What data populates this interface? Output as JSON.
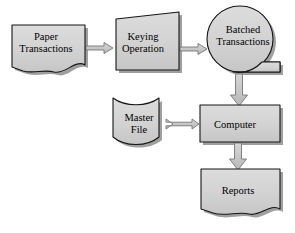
{
  "diagram": {
    "background_color": "#ffffff",
    "shape_fill": "#d2d2d2",
    "shape_stroke": "#1a1a1a",
    "shadow_color": "#8a8a8a",
    "arrow_fill": "#c0c0c0",
    "arrow_stroke": "#6e6e6e",
    "nodes": [
      {
        "id": "paper-transactions",
        "label": "Paper\nTransactions",
        "line1": "Paper",
        "line2": "Transactions",
        "shape": "document"
      },
      {
        "id": "keying-operation",
        "label": "Keying\nOperation",
        "line1": "Keying",
        "line2": "Operation",
        "shape": "manual-operation-trapezoid"
      },
      {
        "id": "batched-transactions",
        "label": "Batched\nTransactions",
        "line1": "Batched",
        "line2": "Transactions",
        "shape": "offline-storage-circle"
      },
      {
        "id": "master-file",
        "label": "Master\nFile",
        "line1": "Master",
        "line2": "File",
        "shape": "magnetic-disk"
      },
      {
        "id": "computer",
        "label": "Computer",
        "line1": "Computer",
        "line2": "",
        "shape": "process-rectangle"
      },
      {
        "id": "reports",
        "label": "Reports",
        "line1": "Reports",
        "line2": "",
        "shape": "document"
      }
    ],
    "connectors": [
      {
        "id": "paper-to-keying",
        "from": "paper-transactions",
        "to": "keying-operation",
        "direction": "right"
      },
      {
        "id": "keying-to-batched",
        "from": "keying-operation",
        "to": "batched-transactions",
        "direction": "right"
      },
      {
        "id": "batched-to-computer",
        "from": "batched-transactions",
        "to": "computer",
        "direction": "down"
      },
      {
        "id": "master-computer",
        "from": "master-file",
        "to": "computer",
        "direction": "both"
      },
      {
        "id": "computer-to-reports",
        "from": "computer",
        "to": "reports",
        "direction": "down"
      }
    ]
  }
}
